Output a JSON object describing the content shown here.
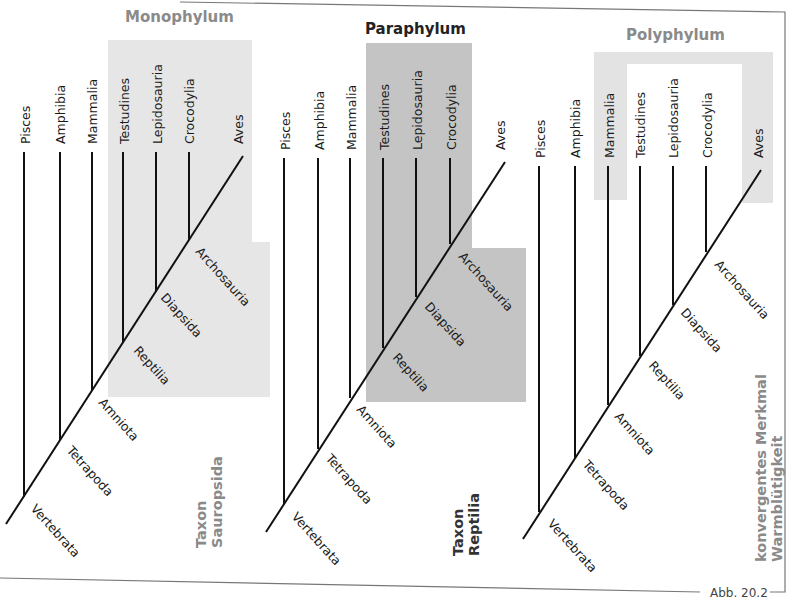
{
  "figure": {
    "caption": "Abb. 20.2",
    "colors": {
      "mono_shade": "#e6e6e6",
      "para_shade": "#c4c4c4",
      "poly_shade": "#e3e3e3",
      "gray_text": "#8a8a8a",
      "dark_text": "#222222"
    }
  },
  "panels": [
    {
      "title": "Monophylum",
      "taxon_line1": "Taxon",
      "taxon_line2": "Sauropsida",
      "leaves": [
        "Pisces",
        "Amphibia",
        "Mammalia",
        "Testudines",
        "Lepidosauria",
        "Crocodylia",
        "Aves"
      ],
      "nodes": [
        "Vertebrata",
        "Tetrapoda",
        "Amniota",
        "Reptilia",
        "Diapsida",
        "Archosauria"
      ]
    },
    {
      "title": "Paraphylum",
      "taxon_line1": "Taxon",
      "taxon_line2": "Reptilia",
      "leaves": [
        "Pisces",
        "Amphibia",
        "Mammalia",
        "Testudines",
        "Lepidosauria",
        "Crocodylia",
        "Aves"
      ],
      "nodes": [
        "Vertebrata",
        "Tetrapoda",
        "Amniota",
        "Reptilia",
        "Diapsida",
        "Archosauria"
      ]
    },
    {
      "title": "Polyphylum",
      "taxon_line1": "konvergentes Merkmal",
      "taxon_line2": "Warmblütigkeit",
      "leaves": [
        "Pisces",
        "Amphibia",
        "Mammalia",
        "Testudines",
        "Lepidosauria",
        "Crocodylia",
        "Aves"
      ],
      "nodes": [
        "Vertebrata",
        "Tetrapoda",
        "Amniota",
        "Reptilia",
        "Diapsida",
        "Archosauria"
      ]
    }
  ]
}
